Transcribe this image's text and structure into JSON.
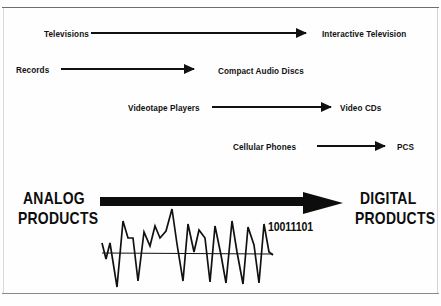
{
  "figure": {
    "rows": [
      {
        "analog_label": "Televisions",
        "digital_label": "Interactive Television",
        "arrow_name": "arrow-televisions-to-interactive-television"
      },
      {
        "analog_label": "Records",
        "digital_label": "Compact Audio Discs",
        "arrow_name": "arrow-records-to-compact-audio-discs"
      },
      {
        "analog_label": "Videotape Players",
        "digital_label": "Video CDs",
        "arrow_name": "arrow-videotape-players-to-video-cds"
      },
      {
        "analog_label": "Cellular Phones",
        "digital_label": "PCS",
        "arrow_name": "arrow-cellular-phones-to-pcs"
      }
    ],
    "summary": {
      "left_line1": "ANALOG",
      "left_line2": "PRODUCTS",
      "right_line1": "DIGITAL",
      "right_line2": "PRODUCTS",
      "binary_sample": "10011101"
    },
    "colors": {
      "ink": "#111111",
      "heavy_ink": "#0d0d0d",
      "background": "#fefefe",
      "frame_line": "#6e6e6e"
    }
  }
}
